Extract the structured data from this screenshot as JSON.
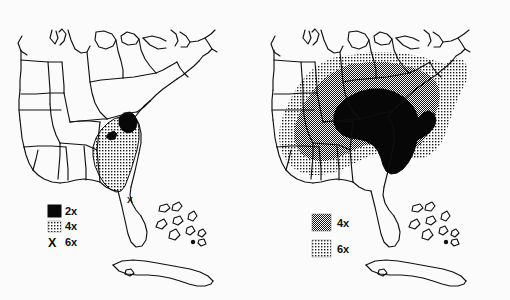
{
  "figure": {
    "type": "map-figure",
    "background_color": "#fbfbfb",
    "ink_color": "#101010",
    "panel_count": 2
  },
  "panels": [
    {
      "id": "left",
      "name": "left-map",
      "region_label": "eastern United States",
      "legend": {
        "name": "legend-left",
        "entries": [
          {
            "swatch": "solid-black",
            "label": "2x"
          },
          {
            "swatch": "light-stipple",
            "label": "4x"
          },
          {
            "swatch": "x-marker",
            "marker": "X",
            "label": "6x"
          }
        ]
      },
      "shaded_zones": [
        {
          "class": "2x",
          "fill": "solid-black",
          "extent": "small coastal blob at the North Carolina / South Carolina border"
        },
        {
          "class": "4x",
          "fill": "light-stipple",
          "extent": "South Carolina, eastern Georgia and northern Florida peninsula"
        }
      ],
      "point_markers": [
        {
          "marker": "X",
          "class": "6x",
          "extent": "central Florida peninsula"
        }
      ]
    },
    {
      "id": "right",
      "name": "right-map",
      "region_label": "eastern United States",
      "legend": {
        "name": "legend-right",
        "entries": [
          {
            "swatch": "dense-checker",
            "label": "4x"
          },
          {
            "swatch": "light-stipple",
            "label": "6x"
          }
        ]
      },
      "shaded_zones": [
        {
          "class": "solid",
          "fill": "solid-black",
          "extent": "Georgia, South Carolina and adjacent Alabama"
        },
        {
          "class": "4x",
          "fill": "dense-checker",
          "extent": "broad band across the southeastern states"
        },
        {
          "class": "6x",
          "fill": "light-stipple",
          "extent": "outer zone from east Texas and Louisiana north to the Ohio valley and up the Atlantic coast to Virginia"
        }
      ],
      "point_markers": []
    }
  ],
  "geography": {
    "features": [
      "Great Lakes",
      "Florida peninsula",
      "Bahamas islands",
      "Cuba",
      "state boundaries"
    ]
  }
}
